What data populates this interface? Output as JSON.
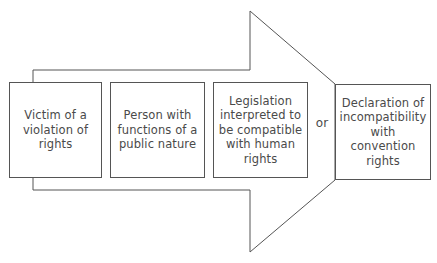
{
  "diagram": {
    "type": "process-arrow",
    "colors": {
      "stroke": "#555555",
      "text": "#4a4a4a",
      "background": "#ffffff"
    },
    "steps": [
      {
        "label": "Victim of a violation of rights",
        "lines": [
          "Victim of a",
          "violation of",
          "rights"
        ]
      },
      {
        "label": "Person with functions of a public nature",
        "lines": [
          "Person with",
          "functions of a",
          "public nature"
        ]
      },
      {
        "label": "Legislation interpreted to be compatible with human rights",
        "lines": [
          "Legislation",
          "interpreted to",
          "be compatible",
          "with human",
          "rights"
        ]
      }
    ],
    "connector": "or",
    "outcome": {
      "label": "Declaration of incompatibility with convention rights",
      "lines": [
        "Declaration of",
        "incompatibility",
        "with",
        "convention",
        "rights"
      ]
    }
  }
}
